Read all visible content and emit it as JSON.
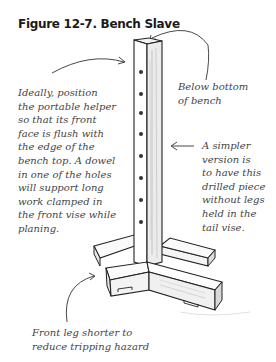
{
  "figure": {
    "title": "Figure 12-7. Bench Slave"
  },
  "annotations": {
    "left_note": "Ideally, position\nthe portable helper\nso that its front\nface is flush with\nthe edge of the\nbench top. A dowel\nin one of the holes\nwill support long\nwork clamped in\nthe front vise while\nplaning.",
    "top_right_note": "Below bottom\nof bench",
    "right_note": "A simpler\nversion is\nto have this\ndrilled piece\nwithout legs\nheld in the\ntail vise.",
    "bottom_note": "Front leg shorter to\nreduce tripping hazard"
  },
  "illustration": {
    "subject": "bench slave: vertical drilled post on cross-shaped foot base",
    "hole_count": 8
  }
}
